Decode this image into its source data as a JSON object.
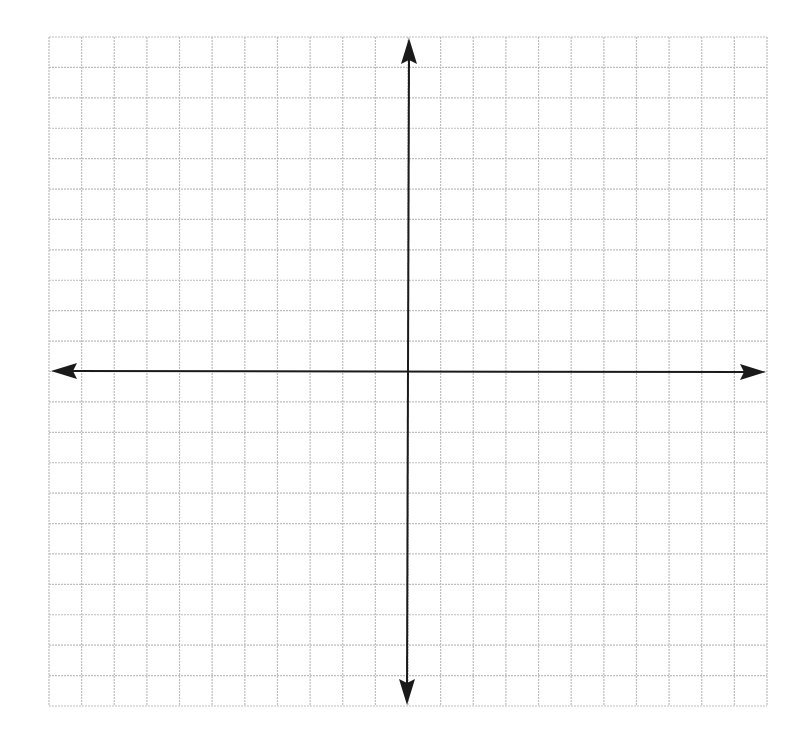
{
  "diagram": {
    "type": "coordinate-plane",
    "grid": {
      "columns": 22,
      "rows": 22,
      "left": 49,
      "top": 37,
      "right": 767,
      "bottom": 706,
      "line_color": "#bdbdbd",
      "line_style": "dotted"
    },
    "axes": {
      "color": "#1a1a1a",
      "origin": {
        "x": 408,
        "y": 371
      },
      "x_axis": {
        "from": 51,
        "to": 766,
        "arrows": "both"
      },
      "y_axis": {
        "from": 38,
        "to": 705,
        "arrows": "both"
      }
    },
    "labels": []
  }
}
